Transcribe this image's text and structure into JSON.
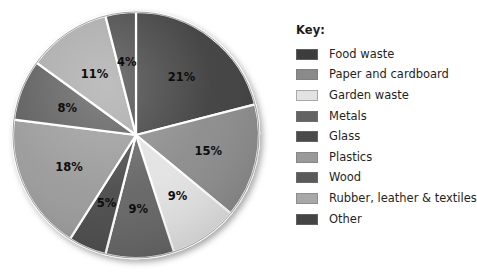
{
  "legend": {
    "title": "Key:",
    "items": [
      {
        "label": "Food waste",
        "color": "#3d3d3d"
      },
      {
        "label": "Paper and cardboard",
        "color": "#8a8a8a"
      },
      {
        "label": "Garden waste",
        "color": "#e2e2e2"
      },
      {
        "label": "Metals",
        "color": "#636363"
      },
      {
        "label": "Glass",
        "color": "#4a4a4a"
      },
      {
        "label": "Plastics",
        "color": "#999999"
      },
      {
        "label": "Wood",
        "color": "#5a5a5a"
      },
      {
        "label": "Rubber, leather & textiles",
        "color": "#a8a8a8"
      },
      {
        "label": "Other",
        "color": "#444444"
      }
    ]
  },
  "chart_data": {
    "type": "pie",
    "title": "",
    "legend_position": "right",
    "legend_title": "Key:",
    "start_angle_deg": 0,
    "direction": "clockwise",
    "units": "percent",
    "total": 100,
    "categories": [
      "Food waste",
      "Paper and cardboard",
      "Garden waste",
      "Metals",
      "Glass",
      "Plastics",
      "Wood",
      "Rubber, leather & textiles",
      "Other"
    ],
    "values": [
      21,
      15,
      9,
      9,
      5,
      18,
      8,
      11,
      4
    ],
    "labels": [
      "21%",
      "15%",
      "9%",
      "9%",
      "5%",
      "18%",
      "8%",
      "11%",
      "4%"
    ],
    "colors": [
      "#3d3d3d",
      "#8a8a8a",
      "#e2e2e2",
      "#636363",
      "#4a4a4a",
      "#999999",
      "#5a5a5a",
      "#a8a8a8",
      "#444444"
    ],
    "slices": [
      {
        "category": "Food waste",
        "value": 21,
        "label": "21%",
        "color": "#3d3d3d"
      },
      {
        "category": "Paper and cardboard",
        "value": 15,
        "label": "15%",
        "color": "#8a8a8a"
      },
      {
        "category": "Garden waste",
        "value": 9,
        "label": "9%",
        "color": "#e2e2e2"
      },
      {
        "category": "Metals",
        "value": 9,
        "label": "9%",
        "color": "#636363"
      },
      {
        "category": "Glass",
        "value": 5,
        "label": "5%",
        "color": "#4a4a4a"
      },
      {
        "category": "Plastics",
        "value": 18,
        "label": "18%",
        "color": "#999999"
      },
      {
        "category": "Wood",
        "value": 8,
        "label": "8%",
        "color": "#5a5a5a"
      },
      {
        "category": "Rubber, leather & textiles",
        "value": 11,
        "label": "11%",
        "color": "#a8a8a8"
      },
      {
        "category": "Other",
        "value": 4,
        "label": "4%",
        "color": "#444444"
      }
    ]
  }
}
